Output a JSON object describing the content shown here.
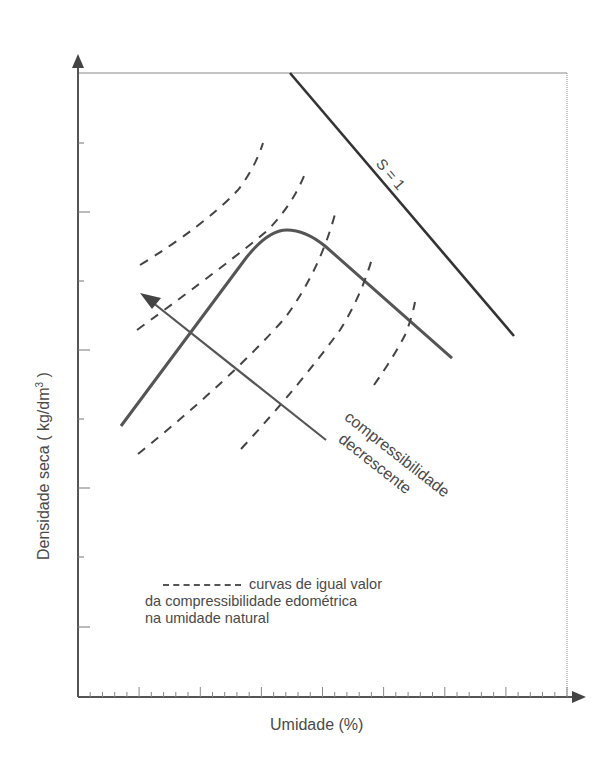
{
  "diagram": {
    "type": "compaction-curve",
    "y_axis_label": "Densidade seca ( kg/dm",
    "y_axis_label_sup": "3",
    "y_axis_label_end": " )",
    "x_axis_label": "Umidade (%)",
    "saturation_line_label": "S = 1",
    "arrow_label_line1": "compressibilidade",
    "arrow_label_line2": "decrescente",
    "legend": {
      "line1": "curvas de igual valor",
      "line2": "da compressibilidade edométrica",
      "line3": "na umidade natural"
    },
    "colors": {
      "axis": "#555555",
      "saturation_line": "#333333",
      "compaction_curve": "#555555",
      "dashed_curves": "#444444",
      "arrow": "#555555",
      "text": "#4a4a4a"
    }
  },
  "chart_data": {
    "type": "line",
    "title": "",
    "xlabel": "Umidade (%)",
    "ylabel": "Densidade seca ( kg/dm³ )",
    "grid": false,
    "axis_ticks": {
      "x_minor_ticks": true,
      "y_ticks_count": 8,
      "tick_labels": []
    },
    "series": [
      {
        "name": "S = 1",
        "style": "solid-dark",
        "description": "saturation line, straight, decreasing"
      },
      {
        "name": "compaction curve",
        "style": "solid",
        "description": "rises to a peak (optimum moisture) then decreases parallel to S = 1"
      },
      {
        "name": "curvas de igual valor da compressibilidade edométrica na umidade natural",
        "style": "dashed",
        "count": 5,
        "description": "iso-compressibility curves, increasing, shifted rightwards"
      }
    ],
    "annotations": [
      {
        "text": "S = 1",
        "position": "along saturation line"
      },
      {
        "text": "compressibilidade decrescente",
        "position": "arrow pointing up-left"
      }
    ],
    "legend_position": "lower-center inside plot"
  }
}
